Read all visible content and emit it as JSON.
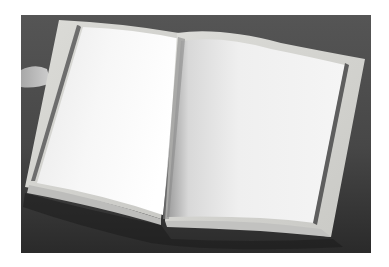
{
  "image": {
    "alt": "Open blank book with empty pages on a dark gray surface",
    "subject": "open-blank-book",
    "colors": {
      "background_frame": "#ffffff",
      "surface": "#4a4a4a",
      "surface_dark": "#262626",
      "page": "#f2f2f2",
      "page_shadow": "#cfcfcf",
      "cover_edge": "#d6d6d2",
      "groove": "#6a6a6a",
      "hand": "#bdbdbd"
    }
  }
}
